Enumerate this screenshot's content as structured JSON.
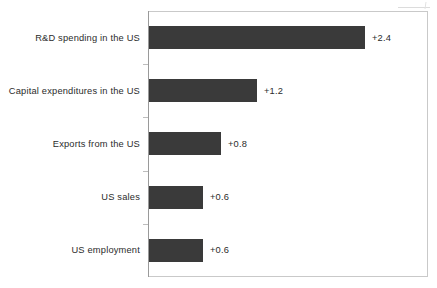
{
  "chart_data": {
    "type": "bar",
    "orientation": "horizontal",
    "title": "",
    "subtitle": "",
    "xlabel": "",
    "ylabel": "",
    "categories": [
      "R&D spending in the US",
      "Capital expenditures in the US",
      "Exports from the US",
      "US sales",
      "US employment"
    ],
    "values": [
      2.4,
      1.2,
      0.8,
      0.6,
      0.6
    ],
    "data_labels": [
      "+2.4",
      "+1.2",
      "+0.8",
      "+0.6",
      "+0.6"
    ],
    "xlim": [
      0,
      3.1
    ],
    "grid": false,
    "legend": null,
    "tick_labels": [],
    "series": [
      {
        "name": "",
        "values": [
          2.4,
          1.2,
          0.8,
          0.6,
          0.6
        ]
      }
    ],
    "colors": {
      "bar": "#3a3a3a",
      "frame": "#c9c9c9",
      "axis": "#9a9a9a",
      "text": "#2b2b2b",
      "background": "#ffffff"
    }
  }
}
